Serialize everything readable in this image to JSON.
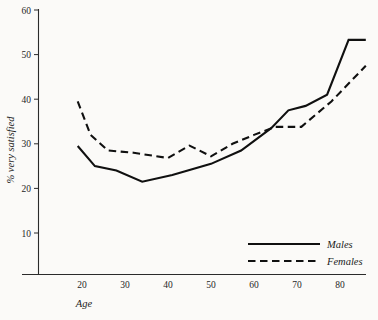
{
  "chart_data": {
    "type": "line",
    "title": "",
    "xlabel": "Age",
    "ylabel": "% very satisfied",
    "xlim": [
      14,
      89
    ],
    "ylim": [
      0,
      62
    ],
    "xticks": [
      20,
      30,
      40,
      50,
      60,
      70,
      80
    ],
    "yticks": [
      10,
      20,
      30,
      40,
      50,
      60
    ],
    "xtick_labels": [
      "20",
      "30",
      "40",
      "50",
      "60",
      "70",
      "80"
    ],
    "ytick_labels": [
      "10",
      "20",
      "30",
      "40",
      "50",
      "60"
    ],
    "grid": false,
    "legend_position": "bottom-right",
    "series": [
      {
        "name": "Males",
        "style": "solid",
        "color": "#101010",
        "x": [
          19,
          23,
          28,
          34,
          41,
          50,
          57,
          64,
          68,
          72,
          77,
          82,
          86
        ],
        "values": [
          29.5,
          25.0,
          24.0,
          21.5,
          23.0,
          25.5,
          28.5,
          33.5,
          37.5,
          38.5,
          41.0,
          53.3,
          53.3
        ]
      },
      {
        "name": "Females",
        "style": "dashed",
        "color": "#101010",
        "x": [
          19,
          22,
          26,
          32,
          40,
          45,
          50,
          55,
          60,
          65,
          71,
          78,
          86
        ],
        "values": [
          39.5,
          32.0,
          28.5,
          28.0,
          26.8,
          29.6,
          27.2,
          30.0,
          32.0,
          33.8,
          33.8,
          39.5,
          47.5
        ]
      }
    ],
    "legend": [
      {
        "label": "Males",
        "style": "solid"
      },
      {
        "label": "Females",
        "style": "dashed"
      }
    ]
  }
}
